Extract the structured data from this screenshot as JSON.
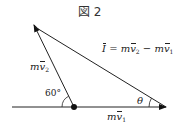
{
  "figure": {
    "title": "図 2"
  },
  "labels": {
    "impulse": {
      "lhs": "I",
      "eq": " = ",
      "m1": "m",
      "v2": "v",
      "sub2": "2",
      "minus": " − ",
      "m2": "m",
      "v1": "v",
      "sub1": "1"
    },
    "mv2": {
      "m": "m",
      "v": "v",
      "sub": "2"
    },
    "mv1": {
      "m": "m",
      "v": "v",
      "sub": "1"
    },
    "angle_60": "60°",
    "theta": "θ"
  },
  "geometry": {
    "origin_dot": [
      74,
      107
    ],
    "mv1_tip": [
      166,
      107
    ],
    "mv2_tip": [
      34,
      25
    ],
    "baseline_start": [
      12,
      107
    ],
    "angle_between_mv2_and_baseline_deg": 60
  },
  "colors": {
    "line": "#222222",
    "background": "#ffffff"
  }
}
